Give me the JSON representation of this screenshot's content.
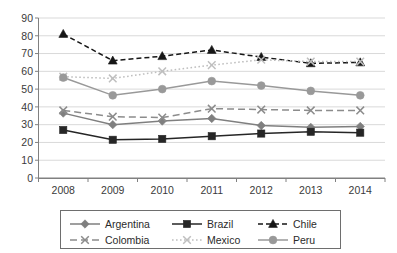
{
  "chart_data": {
    "type": "line",
    "title": "",
    "subtitle": "",
    "xlabel": "",
    "ylabel": "",
    "categories": [
      "2008",
      "2009",
      "2010",
      "2011",
      "2012",
      "2013",
      "2014"
    ],
    "x": [
      2008,
      2009,
      2010,
      2011,
      2012,
      2013,
      2014
    ],
    "ylim": [
      0,
      90
    ],
    "y_ticks": [
      0,
      10,
      20,
      30,
      40,
      50,
      60,
      70,
      80,
      90
    ],
    "grid": true,
    "legend_position": "bottom",
    "series": [
      {
        "name": "Argentina",
        "marker": "diamond",
        "line_style": "solid",
        "color": "#7f7f7f",
        "values": [
          36.5,
          30.0,
          32.0,
          33.5,
          29.5,
          28.5,
          29.0
        ]
      },
      {
        "name": "Brazil",
        "marker": "square",
        "line_style": "solid",
        "color": "#262626",
        "values": [
          27.0,
          21.5,
          22.0,
          23.5,
          25.0,
          26.0,
          25.5
        ]
      },
      {
        "name": "Chile",
        "marker": "triangle",
        "line_style": "dashed",
        "color": "#161616",
        "values": [
          81.0,
          66.0,
          68.5,
          72.0,
          68.0,
          64.5,
          65.0
        ]
      },
      {
        "name": "Colombia",
        "marker": "cross",
        "line_style": "dashed-long",
        "color": "#8c8c8c",
        "values": [
          38.0,
          34.5,
          34.0,
          39.0,
          38.5,
          38.0,
          38.0
        ]
      },
      {
        "name": "Mexico",
        "marker": "cross",
        "line_style": "dotted",
        "color": "#bfbfbf",
        "values": [
          57.0,
          56.0,
          60.0,
          63.5,
          66.5,
          65.5,
          65.5
        ]
      },
      {
        "name": "Peru",
        "marker": "circle",
        "line_style": "solid",
        "color": "#999999",
        "values": [
          56.5,
          46.5,
          50.0,
          54.5,
          52.0,
          49.0,
          46.5
        ]
      }
    ]
  },
  "axis": {
    "y_labels": [
      "90",
      "80",
      "70",
      "60",
      "50",
      "40",
      "30",
      "20",
      "10",
      "0"
    ],
    "x_labels": [
      "2008",
      "2009",
      "2010",
      "2011",
      "2012",
      "2013",
      "2014"
    ]
  },
  "legend": {
    "items": [
      {
        "label": "Argentina",
        "icon": "diamond-marker-icon"
      },
      {
        "label": "Brazil",
        "icon": "square-marker-icon"
      },
      {
        "label": "Chile",
        "icon": "triangle-marker-icon"
      },
      {
        "label": "Colombia",
        "icon": "cross-marker-icon"
      },
      {
        "label": "Mexico",
        "icon": "cross-marker-icon"
      },
      {
        "label": "Peru",
        "icon": "circle-marker-icon"
      }
    ]
  }
}
